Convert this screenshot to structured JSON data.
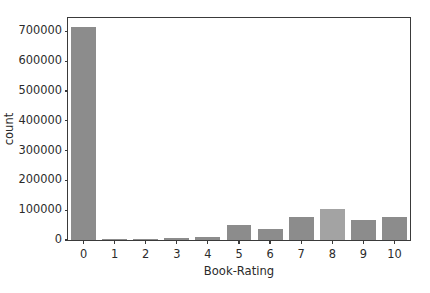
{
  "chart_data": {
    "type": "bar",
    "title": "",
    "subtitle": "",
    "xlabel": "Book-Rating",
    "ylabel": "count",
    "categories": [
      "0",
      "1",
      "2",
      "3",
      "4",
      "5",
      "6",
      "7",
      "8",
      "9",
      "10"
    ],
    "values": [
      715000,
      1800,
      2800,
      5500,
      8900,
      50700,
      36000,
      76500,
      103700,
      67500,
      78600
    ],
    "series": [
      {
        "name": "count",
        "values": [
          715000,
          1800,
          2800,
          5500,
          8900,
          50700,
          36000,
          76500,
          103700,
          67500,
          78600
        ]
      }
    ],
    "xlim": [
      -0.5,
      10.5
    ],
    "ylim": [
      0,
      745000
    ],
    "ytick_labels": [
      "0",
      "100000",
      "200000",
      "300000",
      "400000",
      "500000",
      "600000",
      "700000"
    ],
    "ytick_values": [
      0,
      100000,
      200000,
      300000,
      400000,
      500000,
      600000,
      700000
    ],
    "xtick_labels": [
      "0",
      "1",
      "2",
      "3",
      "4",
      "5",
      "6",
      "7",
      "8",
      "9",
      "10"
    ],
    "grid": false,
    "legend": false,
    "legend_position": "none",
    "bar_color": "#8c8c8c",
    "highlight_bar_color": "#a3a3a3",
    "highlight_index": 8,
    "axis_color": "#3a3a3a",
    "text_color": "#2b2b2b",
    "background_color": "#ffffff"
  }
}
